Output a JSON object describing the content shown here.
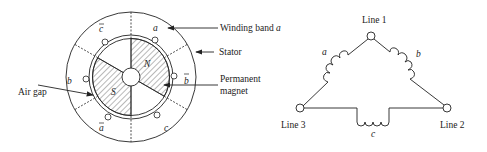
{
  "motor": {
    "labels": {
      "winding_band_prefix": "Winding band ",
      "winding_band_var": "a",
      "stator": "Stator",
      "permanent_magnet_line1": "Permanent",
      "permanent_magnet_line2": "magnet",
      "air_gap": "Air gap",
      "rotor_north": "N",
      "rotor_south": "S"
    },
    "slots": {
      "a": "a",
      "a_bar": "a",
      "b": "b",
      "b_bar": "b",
      "c": "c",
      "c_bar": "c"
    }
  },
  "delta": {
    "line1": "Line 1",
    "line2": "Line 2",
    "line3": "Line 3",
    "coil_a": "a",
    "coil_b": "b",
    "coil_c": "c"
  },
  "colors": {
    "stroke": "#222222",
    "background": "#ffffff"
  }
}
